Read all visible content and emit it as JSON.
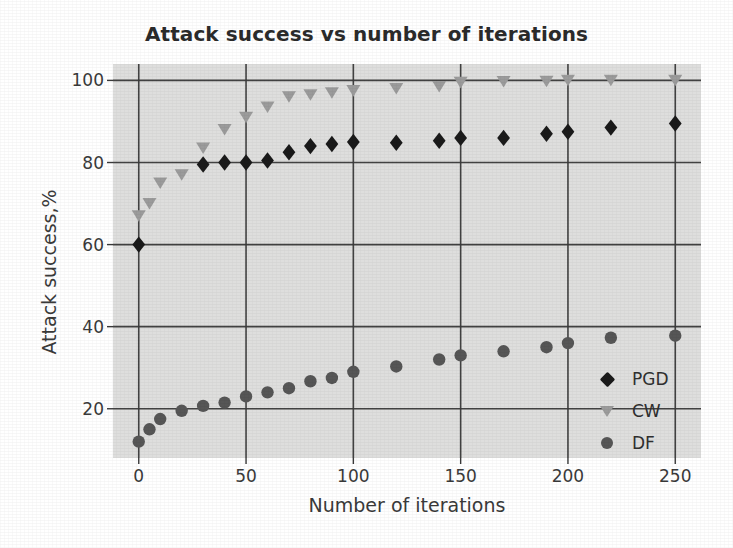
{
  "chart_data": {
    "type": "scatter",
    "title": "Attack success vs number of iterations",
    "xlabel": "Number of iterations",
    "ylabel": "Attack success,%",
    "xlim": [
      -12,
      262
    ],
    "ylim": [
      8,
      104
    ],
    "xticks": [
      0,
      50,
      100,
      150,
      200,
      250
    ],
    "xtick_labels": [
      "0",
      "50",
      "100",
      "150",
      "200",
      "250"
    ],
    "yticks": [
      20,
      40,
      60,
      80,
      100
    ],
    "ytick_labels": [
      "20",
      "40",
      "60",
      "80",
      "100"
    ],
    "grid": true,
    "grid_color": "#3a3a3a",
    "plot_background": "#dededd",
    "legend_position": "lower right",
    "series": [
      {
        "name": "PGD",
        "marker": "diamond",
        "color": "#1a1a1a",
        "x": [
          0,
          30,
          40,
          50,
          60,
          70,
          80,
          90,
          100,
          120,
          140,
          150,
          170,
          190,
          200,
          220,
          250
        ],
        "y": [
          60.0,
          79.5,
          80.0,
          80.0,
          80.5,
          82.5,
          84.0,
          84.5,
          85.0,
          84.8,
          85.3,
          86.0,
          86.0,
          87.0,
          87.5,
          88.5,
          89.5
        ]
      },
      {
        "name": "CW",
        "marker": "triangle-down",
        "color": "#9b9b9b",
        "x": [
          0,
          5,
          10,
          20,
          30,
          40,
          50,
          60,
          70,
          80,
          90,
          100,
          120,
          140,
          150,
          170,
          190,
          200,
          220,
          250
        ],
        "y": [
          67.0,
          70.0,
          75.0,
          77.0,
          83.5,
          88.0,
          91.0,
          93.5,
          96.0,
          96.5,
          97.0,
          97.5,
          98.0,
          98.5,
          99.5,
          99.7,
          99.8,
          100.0,
          100.0,
          100.0
        ]
      },
      {
        "name": "DF",
        "marker": "circle",
        "color": "#565656",
        "x": [
          0,
          5,
          10,
          20,
          30,
          40,
          50,
          60,
          70,
          80,
          90,
          100,
          120,
          140,
          150,
          170,
          190,
          200,
          220,
          250
        ],
        "y": [
          12.0,
          15.0,
          17.5,
          19.5,
          20.7,
          21.5,
          23.0,
          24.0,
          25.0,
          26.7,
          27.5,
          29.0,
          30.3,
          32.0,
          33.0,
          34.0,
          35.0,
          36.0,
          37.3,
          37.8
        ]
      }
    ]
  },
  "legend": {
    "entries": [
      {
        "label": "PGD",
        "marker": "diamond-icon",
        "color": "#1a1a1a"
      },
      {
        "label": "CW",
        "marker": "triangle-down-icon",
        "color": "#9b9b9b"
      },
      {
        "label": "DF",
        "marker": "circle-icon",
        "color": "#565656"
      }
    ]
  }
}
